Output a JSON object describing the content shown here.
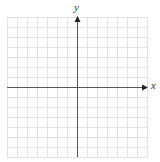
{
  "diagram": {
    "type": "coordinate-grid",
    "x_axis_label": "x",
    "y_axis_label": "y",
    "grid": {
      "left": 7,
      "top": 17,
      "cell_size": 10,
      "cols": 14,
      "rows": 14,
      "origin_col": 7,
      "origin_row": 7
    },
    "colors": {
      "grid": "#e2e2e2",
      "axis": "#555555",
      "label": "#333333"
    }
  }
}
